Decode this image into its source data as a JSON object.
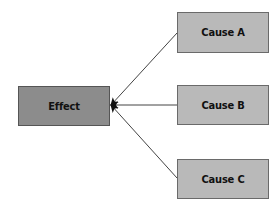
{
  "diagram": {
    "type": "cause-effect",
    "effect": {
      "label": "Effect",
      "fill": "#8c8c8c"
    },
    "causes": [
      {
        "label": "Cause A",
        "fill": "#b9b9b9"
      },
      {
        "label": "Cause B",
        "fill": "#b9b9b9"
      },
      {
        "label": "Cause C",
        "fill": "#b9b9b9"
      }
    ],
    "edges": [
      {
        "from": "Cause A",
        "to": "Effect"
      },
      {
        "from": "Cause B",
        "to": "Effect"
      },
      {
        "from": "Cause C",
        "to": "Effect"
      }
    ]
  }
}
